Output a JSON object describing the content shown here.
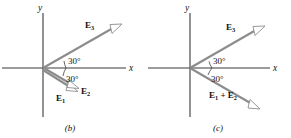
{
  "figure": {
    "colors": {
      "axis": "#3a3a3a",
      "vector": "#8c8c8c",
      "arrowhead_fill": "#ffffff",
      "text": "#111111",
      "background": "#ffffff"
    },
    "panels": [
      {
        "caption": "(b)",
        "axes": {
          "x_label": "x",
          "y_label": "y"
        },
        "origin": {
          "x": 43,
          "y": 68
        },
        "vectors": [
          {
            "name": "E3",
            "label_main": "E",
            "label_sub": "3",
            "label_text": "E₃",
            "angle_deg": 30,
            "direction": "up-right",
            "tip": {
              "x": 120,
              "y": 25
            }
          },
          {
            "name": "E2",
            "label_main": "E",
            "label_sub": "2",
            "label_text": "E₂",
            "angle_deg": -30,
            "direction": "down-right",
            "tip": {
              "x": 79,
              "y": 90
            }
          },
          {
            "name": "E1",
            "label_main": "E",
            "label_sub": "1",
            "label_text": "E₁",
            "angle_deg": -30,
            "direction": "down-right",
            "tip": {
              "x": 76,
              "y": 92
            }
          }
        ],
        "angle_labels": [
          {
            "text": "30°",
            "position": "above-x-axis"
          },
          {
            "text": "30°",
            "position": "below-x-axis"
          }
        ]
      },
      {
        "caption": "(c)",
        "axes": {
          "x_label": "x",
          "y_label": "y"
        },
        "origin": {
          "x": 44,
          "y": 68
        },
        "vectors": [
          {
            "name": "E3",
            "label_main": "E",
            "label_sub": "3",
            "label_text": "E₃",
            "angle_deg": 30,
            "direction": "up-right",
            "tip": {
              "x": 118,
              "y": 26
            }
          },
          {
            "name": "E1+E2",
            "label_text": "E₁ + E₂",
            "label_parts": [
              "E",
              "1",
              "+",
              "E",
              "2"
            ],
            "angle_deg": -30,
            "direction": "down-right",
            "tip": {
              "x": 116,
              "y": 110
            }
          }
        ],
        "angle_labels": [
          {
            "text": "30°",
            "position": "above-x-axis"
          },
          {
            "text": "30°",
            "position": "below-x-axis"
          }
        ]
      }
    ]
  }
}
